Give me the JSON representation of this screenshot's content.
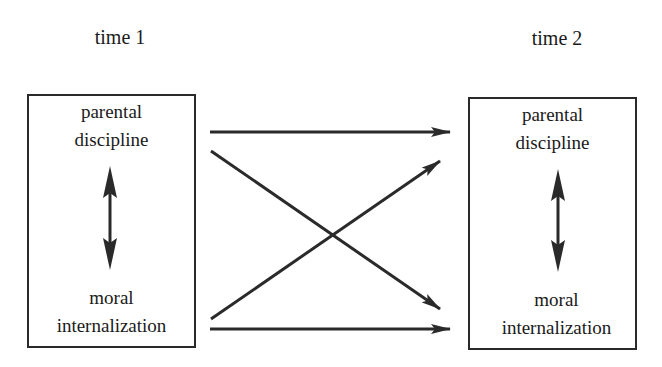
{
  "diagram": {
    "type": "cross-lagged panel model",
    "time1": {
      "title": "time 1",
      "top_variable": [
        "parental",
        "discipline"
      ],
      "bottom_variable": [
        "moral",
        "internalization"
      ]
    },
    "time2": {
      "title": "time 2",
      "top_variable": [
        "parental",
        "discipline"
      ],
      "bottom_variable": [
        "moral",
        "internalization"
      ]
    },
    "edges": [
      {
        "from": "time1.parental discipline",
        "to": "time2.parental discipline",
        "kind": "autoregressive"
      },
      {
        "from": "time1.parental discipline",
        "to": "time2.moral internalization",
        "kind": "cross-lagged"
      },
      {
        "from": "time1.moral internalization",
        "to": "time2.parental discipline",
        "kind": "cross-lagged"
      },
      {
        "from": "time1.moral internalization",
        "to": "time2.moral internalization",
        "kind": "autoregressive"
      },
      {
        "between": [
          "time1.parental discipline",
          "time1.moral internalization"
        ],
        "kind": "bidirectional"
      },
      {
        "between": [
          "time2.parental discipline",
          "time2.moral internalization"
        ],
        "kind": "bidirectional"
      }
    ],
    "colors": {
      "stroke": "#2a2a2a",
      "background": "#ffffff"
    }
  }
}
